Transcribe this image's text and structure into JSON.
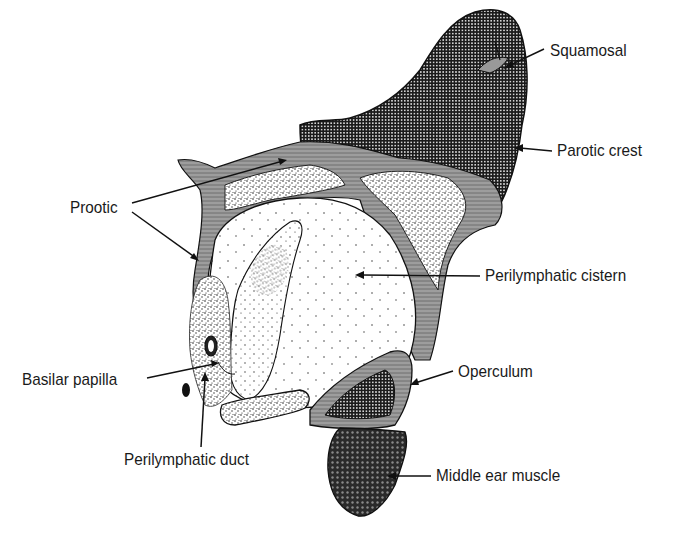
{
  "figure": {
    "type": "anatomical-illustration",
    "ink_color": "#1a1a1a",
    "background_color": "#ffffff"
  },
  "labels": {
    "squamosal": "Squamosal",
    "parotic_crest": "Parotic crest",
    "prootic": "Prootic",
    "perilymphatic_cistern": "Perilymphatic cistern",
    "basilar_papilla": "Basilar papilla",
    "operculum": "Operculum",
    "perilymphatic_duct": "Perilymphatic duct",
    "middle_ear_muscle": "Middle ear muscle"
  }
}
